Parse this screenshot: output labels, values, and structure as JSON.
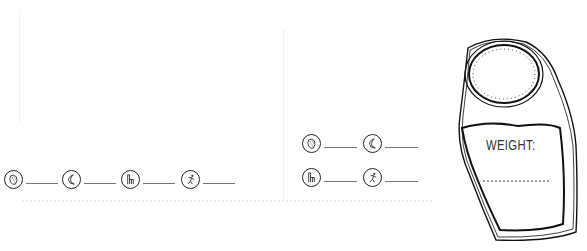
{
  "page": {
    "background": "#ffffff",
    "ink_color": "#222222"
  },
  "trackers": {
    "row_left": [
      {
        "icon": "food-icon",
        "value": ""
      },
      {
        "icon": "sleep-moon-icon",
        "value": ""
      },
      {
        "icon": "toilet-icon",
        "value": ""
      },
      {
        "icon": "exercise-icon",
        "value": ""
      }
    ],
    "grid_right": [
      {
        "icon": "food-icon",
        "value": ""
      },
      {
        "icon": "sleep-moon-icon",
        "value": ""
      },
      {
        "icon": "toilet-icon",
        "value": ""
      },
      {
        "icon": "exercise-icon",
        "value": ""
      }
    ]
  },
  "scale": {
    "label": "WEIGHT:",
    "value": ""
  }
}
